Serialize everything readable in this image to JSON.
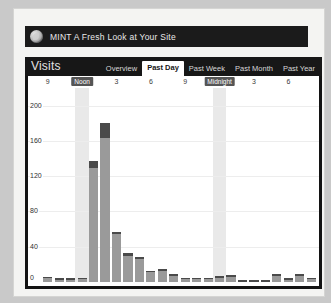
{
  "header": {
    "logo_icon": "mint-leaf-icon",
    "title": "MINT A Fresh Look at Your Site"
  },
  "panel": {
    "title": "Visits",
    "tabs": [
      {
        "label": "Overview",
        "active": false
      },
      {
        "label": "Past Day",
        "active": true
      },
      {
        "label": "Past Week",
        "active": false
      },
      {
        "label": "Past Month",
        "active": false
      },
      {
        "label": "Past Year",
        "active": false
      }
    ]
  },
  "chart_data": {
    "type": "bar",
    "title": "Visits",
    "xlabel": "",
    "ylabel": "",
    "ylim": [
      0,
      220
    ],
    "grid": true,
    "legend": false,
    "yticks": [
      0,
      40,
      80,
      120,
      160,
      200
    ],
    "ytick_labels": [
      "0",
      "40",
      "80",
      "120",
      "160",
      "200"
    ],
    "xtick_labels": [
      "9",
      "Noon",
      "3",
      "6",
      "9",
      "Midnight",
      "3",
      "6"
    ],
    "xtick_highlighted": [
      "Noon",
      "Midnight"
    ],
    "highlight_bands": [
      "Noon",
      "Midnight"
    ],
    "bar_color": "#9a9a9a",
    "cap_color": "#4a4a4a",
    "categories": [
      "9",
      "10",
      "11",
      "Noon",
      "1",
      "2",
      "3",
      "4",
      "5",
      "6",
      "7",
      "8",
      "9",
      "10",
      "11",
      "Midnight",
      "1",
      "2",
      "3",
      "4",
      "5",
      "6",
      "7",
      "8"
    ],
    "values": [
      6,
      4,
      4,
      5,
      137,
      180,
      57,
      33,
      28,
      13,
      15,
      9,
      5,
      5,
      5,
      7,
      8,
      2,
      2,
      2,
      9,
      4,
      9,
      5
    ],
    "cap_values": [
      2,
      1,
      1,
      1,
      8,
      17,
      3,
      3,
      2,
      2,
      2,
      1,
      1,
      1,
      1,
      2,
      2,
      1,
      1,
      1,
      2,
      1,
      2,
      1
    ]
  }
}
